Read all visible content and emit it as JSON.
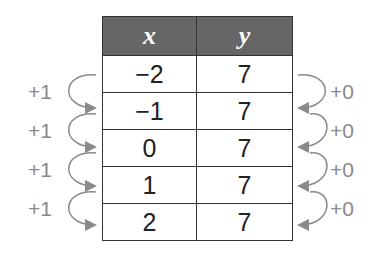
{
  "table": {
    "headers": [
      "x",
      "y"
    ],
    "rows": [
      {
        "x": "−2",
        "y": "7"
      },
      {
        "x": "−1",
        "y": "7"
      },
      {
        "x": "0",
        "y": "7"
      },
      {
        "x": "1",
        "y": "7"
      },
      {
        "x": "2",
        "y": "7"
      }
    ]
  },
  "left_arrows": [
    "+1",
    "+1",
    "+1",
    "+1"
  ],
  "right_arrows": [
    "+0",
    "+0",
    "+0",
    "+0"
  ],
  "arrow_color": "#8a8a8a",
  "header_color": "#666666"
}
